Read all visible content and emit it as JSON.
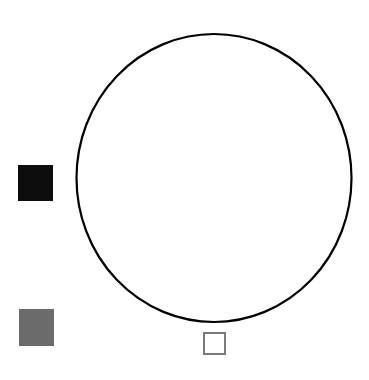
{
  "diagram": {
    "background": "#ffffff",
    "circle": {
      "cx": 214,
      "cy": 178,
      "rx": 137.5,
      "ry": 144,
      "stroke": "#000000",
      "stroke_width": 2.2,
      "fill": "#ffffff"
    },
    "squares": [
      {
        "id": "black-square",
        "x": 18,
        "y": 165,
        "w": 35,
        "h": 36,
        "fill": "#0d0d0d",
        "outline": false
      },
      {
        "id": "gray-square",
        "x": 19,
        "y": 309,
        "w": 35,
        "h": 37,
        "fill": "#6b6b6b",
        "outline": false
      },
      {
        "id": "outlined-square",
        "x": 203,
        "y": 332,
        "w": 23,
        "h": 23,
        "fill": "#ffffff",
        "stroke": "#7a7a7a",
        "outline": true
      }
    ]
  }
}
